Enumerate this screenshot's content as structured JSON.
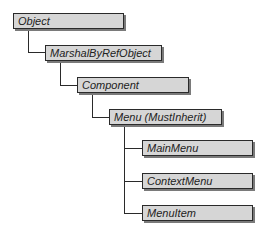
{
  "diagram": {
    "type": "class-hierarchy",
    "nodes": [
      {
        "id": "object",
        "label": "Object"
      },
      {
        "id": "marshal",
        "label": "MarshalByRefObject"
      },
      {
        "id": "component",
        "label": "Component"
      },
      {
        "id": "menu",
        "label": "Menu (MustInherit)"
      },
      {
        "id": "mainmenu",
        "label": "MainMenu"
      },
      {
        "id": "contextmenu",
        "label": "ContextMenu"
      },
      {
        "id": "menuitem",
        "label": "MenuItem"
      }
    ],
    "edges": [
      [
        "object",
        "marshal"
      ],
      [
        "marshal",
        "component"
      ],
      [
        "component",
        "menu"
      ],
      [
        "menu",
        "mainmenu"
      ],
      [
        "menu",
        "contextmenu"
      ],
      [
        "menu",
        "menuitem"
      ]
    ]
  }
}
